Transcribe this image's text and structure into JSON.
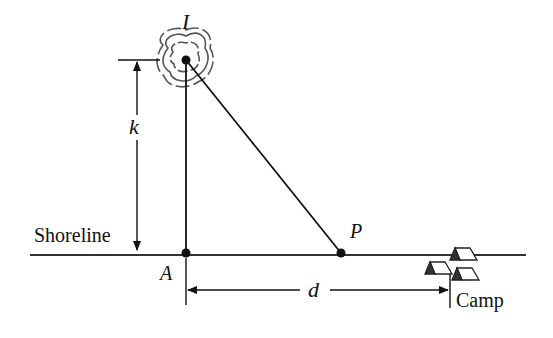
{
  "diagram": {
    "labels": {
      "island": "I",
      "shoreline": "Shoreline",
      "point_a": "A",
      "point_p": "P",
      "distance_k": "k",
      "distance_d": "d",
      "camp": "Camp"
    },
    "colors": {
      "line": "#111111",
      "background": "#ffffff",
      "island_outline": "#555555"
    }
  }
}
